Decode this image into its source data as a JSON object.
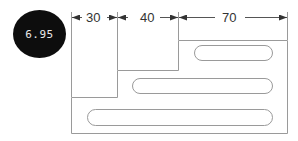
{
  "badge": {
    "label": "6.95",
    "background": "#0d0d0d",
    "text_color": "#e8e8e8"
  },
  "drawing": {
    "type": "stepped-plate-with-slots",
    "line_color": "#9a9a9a",
    "dimensions": [
      {
        "label": "30"
      },
      {
        "label": "40"
      },
      {
        "label": "70"
      }
    ],
    "slots": [
      {
        "name": "top-slot"
      },
      {
        "name": "middle-slot"
      },
      {
        "name": "bottom-slot"
      }
    ]
  }
}
